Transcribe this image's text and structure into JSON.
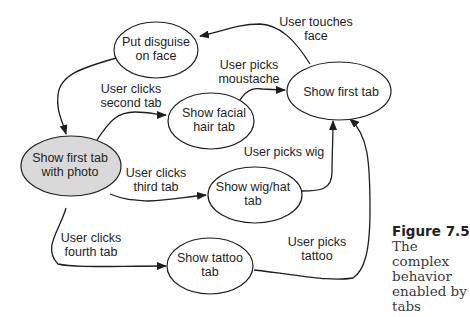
{
  "diagram": {
    "type": "state-transition",
    "nodes": [
      {
        "id": "disguise",
        "lines": [
          "Put disguise",
          "on face"
        ],
        "fill": "#ffffff"
      },
      {
        "id": "facial",
        "lines": [
          "Show facial",
          "hair tab"
        ],
        "fill": "#ffffff"
      },
      {
        "id": "first",
        "lines": [
          "Show first tab"
        ],
        "fill": "#ffffff"
      },
      {
        "id": "photo",
        "lines": [
          "Show first tab",
          "with photo"
        ],
        "fill": "#d9d9d9"
      },
      {
        "id": "wig",
        "lines": [
          "Show wig/hat",
          "tab"
        ],
        "fill": "#ffffff"
      },
      {
        "id": "tattoo",
        "lines": [
          "Show tattoo",
          "tab"
        ],
        "fill": "#ffffff"
      }
    ],
    "edges": [
      {
        "from": "first",
        "to": "disguise",
        "lines": [
          "User touches",
          "face"
        ]
      },
      {
        "from": "disguise",
        "to": "photo",
        "lines": []
      },
      {
        "from": "photo",
        "to": "facial",
        "lines": [
          "User clicks",
          "second tab"
        ]
      },
      {
        "from": "facial",
        "to": "first",
        "lines": [
          "User picks",
          "moustache"
        ]
      },
      {
        "from": "photo",
        "to": "wig",
        "lines": [
          "User clicks",
          "third tab"
        ]
      },
      {
        "from": "wig",
        "to": "first",
        "lines": [
          "User picks wig"
        ]
      },
      {
        "from": "photo",
        "to": "tattoo",
        "lines": [
          "User clicks",
          "fourth tab"
        ]
      },
      {
        "from": "tattoo",
        "to": "first",
        "lines": [
          "User picks",
          "tattoo"
        ]
      }
    ]
  },
  "caption": {
    "figure_number": "Figure 7.5",
    "text": "The complex behavior enabled by tabs"
  }
}
